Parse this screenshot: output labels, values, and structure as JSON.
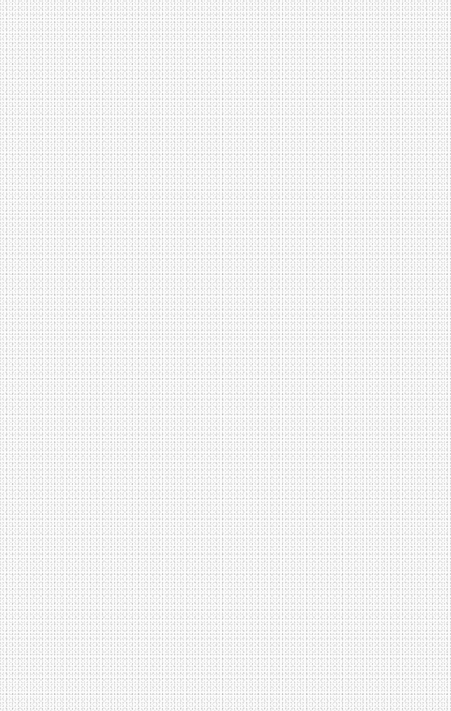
{
  "page": {
    "background_color": "#fbfbfb",
    "noise_color": "#b0b0b0",
    "content": []
  }
}
